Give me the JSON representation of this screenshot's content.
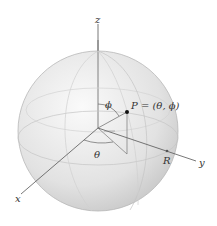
{
  "diagram": {
    "type": "spherical-coordinates-sphere",
    "labels": {
      "z_axis": "z",
      "x_axis": "x",
      "y_axis": "y",
      "phi": "ϕ",
      "theta": "θ",
      "point": "P = (θ, ϕ)",
      "radius": "R"
    },
    "colors": {
      "sphere_fill": "#e4e4e4",
      "sphere_edge": "#b8b8b8",
      "axis": "#555555",
      "point": "#111111"
    }
  }
}
